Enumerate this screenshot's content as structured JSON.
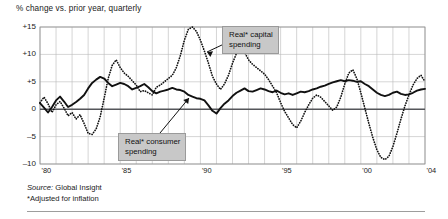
{
  "chart_title": "% change vs. prior year, quarterly",
  "source": {
    "source_label": "Source:",
    "source_value": " Global Insight",
    "footnote": "*Adjusted for inflation"
  },
  "callouts": [
    {
      "id": "capital",
      "line1": "Real* capital",
      "line2": "spending"
    },
    {
      "id": "consumer",
      "line1": "Real* consumer",
      "line2": "spending"
    }
  ],
  "colors": {
    "line": "#111111",
    "grid": "#b9b9b9",
    "frame": "#8f8f8f",
    "zero_axis": "#55565a",
    "callout_bg": "#c8c8c8",
    "callout_border": "#9a9a9a",
    "background": "#ffffff"
  },
  "chart_data": {
    "type": "line",
    "title": "% change vs. prior year, quarterly",
    "xlabel": "",
    "ylabel": "% change vs. prior year",
    "xlim": [
      1980,
      2004
    ],
    "ylim": [
      -10,
      15
    ],
    "yticks": [
      -10,
      -5,
      0,
      5,
      10,
      15
    ],
    "ytick_labels": [
      "–10",
      "–5",
      "0",
      "+5",
      "+10",
      "+15"
    ],
    "xticks": [
      1980,
      1985,
      1990,
      1995,
      2000,
      2004
    ],
    "xtick_labels": [
      "'80",
      "'85",
      "'90",
      "'95",
      "'00",
      "'04"
    ],
    "grid": true,
    "gridline_years_every": 1,
    "legend_position": "annotation-callouts",
    "frequency": "quarterly",
    "series": [
      {
        "name": "Real* consumer spending",
        "style": "solid",
        "x": [
          1980.0,
          1980.25,
          1980.5,
          1980.75,
          1981.0,
          1981.25,
          1981.5,
          1981.75,
          1982.0,
          1982.25,
          1982.5,
          1982.75,
          1983.0,
          1983.25,
          1983.5,
          1983.75,
          1984.0,
          1984.25,
          1984.5,
          1984.75,
          1985.0,
          1985.25,
          1985.5,
          1985.75,
          1986.0,
          1986.25,
          1986.5,
          1986.75,
          1987.0,
          1987.25,
          1987.5,
          1987.75,
          1988.0,
          1988.25,
          1988.5,
          1988.75,
          1989.0,
          1989.25,
          1989.5,
          1989.75,
          1990.0,
          1990.25,
          1990.5,
          1990.75,
          1991.0,
          1991.25,
          1991.5,
          1991.75,
          1992.0,
          1992.25,
          1992.5,
          1992.75,
          1993.0,
          1993.25,
          1993.5,
          1993.75,
          1994.0,
          1994.25,
          1994.5,
          1994.75,
          1995.0,
          1995.25,
          1995.5,
          1995.75,
          1996.0,
          1996.25,
          1996.5,
          1996.75,
          1997.0,
          1997.25,
          1997.5,
          1997.75,
          1998.0,
          1998.25,
          1998.5,
          1998.75,
          1999.0,
          1999.25,
          1999.5,
          1999.75,
          2000.0,
          2000.25,
          2000.5,
          2000.75,
          2001.0,
          2001.25,
          2001.5,
          2001.75,
          2002.0,
          2002.25,
          2002.5,
          2002.75,
          2003.0,
          2003.25,
          2003.5,
          2003.75,
          2004.0
        ],
        "values": [
          1.1,
          0.3,
          -0.6,
          0.4,
          1.6,
          2.3,
          1.4,
          0.4,
          0.8,
          1.3,
          1.9,
          2.6,
          3.8,
          4.8,
          5.4,
          5.9,
          5.6,
          4.8,
          4.2,
          4.5,
          4.8,
          4.6,
          4.2,
          3.6,
          3.9,
          4.2,
          4.6,
          4.0,
          3.3,
          2.9,
          3.2,
          3.4,
          3.6,
          3.9,
          3.6,
          3.5,
          3.2,
          2.6,
          2.3,
          2.0,
          1.9,
          1.6,
          0.7,
          -0.3,
          -0.8,
          0.2,
          1.0,
          1.6,
          2.4,
          3.0,
          3.4,
          3.8,
          3.3,
          3.2,
          3.5,
          3.8,
          3.6,
          3.3,
          3.1,
          3.4,
          3.0,
          2.7,
          2.9,
          2.6,
          2.9,
          3.2,
          3.1,
          3.3,
          3.6,
          3.8,
          4.1,
          4.3,
          4.6,
          4.9,
          5.1,
          5.3,
          5.1,
          5.3,
          5.2,
          5.0,
          5.1,
          4.6,
          4.2,
          3.6,
          3.0,
          2.6,
          2.4,
          2.6,
          3.0,
          3.2,
          2.8,
          2.6,
          2.7,
          3.0,
          3.4,
          3.6,
          3.7
        ]
      },
      {
        "name": "Real* capital spending",
        "style": "dotted",
        "x": [
          1980.0,
          1980.25,
          1980.5,
          1980.75,
          1981.0,
          1981.25,
          1981.5,
          1981.75,
          1982.0,
          1982.25,
          1982.5,
          1982.75,
          1983.0,
          1983.25,
          1983.5,
          1983.75,
          1984.0,
          1984.25,
          1984.5,
          1984.75,
          1985.0,
          1985.25,
          1985.5,
          1985.75,
          1986.0,
          1986.25,
          1986.5,
          1986.75,
          1987.0,
          1987.25,
          1987.5,
          1987.75,
          1988.0,
          1988.25,
          1988.5,
          1988.75,
          1989.0,
          1989.25,
          1989.5,
          1989.75,
          1990.0,
          1990.25,
          1990.5,
          1990.75,
          1991.0,
          1991.25,
          1991.5,
          1991.75,
          1992.0,
          1992.25,
          1992.5,
          1992.75,
          1993.0,
          1993.25,
          1993.5,
          1993.75,
          1994.0,
          1994.25,
          1994.5,
          1994.75,
          1995.0,
          1995.25,
          1995.5,
          1995.75,
          1996.0,
          1996.25,
          1996.5,
          1996.75,
          1997.0,
          1997.25,
          1997.5,
          1997.75,
          1998.0,
          1998.25,
          1998.5,
          1998.75,
          1999.0,
          1999.25,
          1999.5,
          1999.75,
          2000.0,
          2000.25,
          2000.5,
          2000.75,
          2001.0,
          2001.25,
          2001.5,
          2001.75,
          2002.0,
          2002.25,
          2002.5,
          2002.75,
          2003.0,
          2003.25,
          2003.5,
          2003.75,
          2004.0
        ],
        "values": [
          1.2,
          2.2,
          1.0,
          -0.6,
          0.8,
          1.4,
          0.2,
          -1.2,
          -0.6,
          -1.8,
          -1.0,
          -2.6,
          -4.4,
          -4.6,
          -3.6,
          -1.4,
          2.0,
          5.6,
          8.0,
          9.0,
          7.6,
          6.6,
          6.0,
          5.2,
          4.4,
          3.2,
          3.4,
          3.0,
          2.6,
          4.0,
          4.4,
          5.0,
          5.6,
          6.2,
          7.6,
          9.8,
          12.6,
          14.6,
          15.0,
          14.2,
          12.6,
          10.6,
          8.4,
          6.0,
          4.6,
          3.6,
          4.6,
          6.2,
          8.4,
          10.2,
          11.4,
          10.4,
          9.0,
          8.2,
          7.6,
          7.0,
          6.4,
          5.4,
          4.2,
          3.0,
          1.2,
          -0.4,
          -1.6,
          -2.8,
          -3.4,
          -2.2,
          -0.6,
          0.8,
          2.0,
          2.6,
          2.2,
          1.4,
          0.6,
          -0.2,
          0.4,
          2.2,
          4.6,
          6.6,
          7.2,
          5.6,
          3.0,
          0.2,
          -2.6,
          -5.2,
          -7.4,
          -8.8,
          -9.2,
          -8.6,
          -6.8,
          -4.4,
          -1.8,
          0.6,
          2.6,
          4.4,
          5.6,
          6.2,
          5.0
        ]
      }
    ]
  }
}
